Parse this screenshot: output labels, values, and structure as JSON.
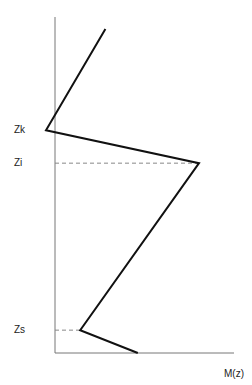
{
  "chart_data": {
    "type": "line",
    "title": "",
    "xlabel": "M(z)",
    "ylabel": "",
    "xlim": [
      0,
      1
    ],
    "ylim": [
      0,
      1
    ],
    "levels": [
      {
        "name": "Zk",
        "label": "Zk",
        "z": 0.663,
        "dashed": false
      },
      {
        "name": "Zi",
        "label": "Zi",
        "z": 0.565,
        "dashed": true
      },
      {
        "name": "Zs",
        "label": "Zs",
        "z": 0.068,
        "dashed": true
      }
    ],
    "series": [
      {
        "name": "M(z) profile",
        "color": "#111111",
        "points": [
          {
            "x": 0.28,
            "z": 0.964
          },
          {
            "x": -0.05,
            "z": 0.663
          },
          {
            "x": 0.8,
            "z": 0.565
          },
          {
            "x": 0.14,
            "z": 0.068
          },
          {
            "x": 0.46,
            "z": 0.0
          }
        ]
      }
    ],
    "axis_color": "#777777",
    "dash_color": "#888888"
  }
}
